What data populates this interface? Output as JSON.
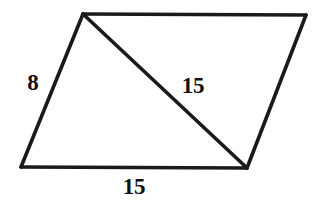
{
  "figure": {
    "kind": "parallelogram-with-diagonal",
    "background_color": "#ffffff",
    "stroke_color": "#1a1a1a",
    "label_color": "#111111",
    "canvas": {
      "width": 322,
      "height": 210
    },
    "vertices": {
      "top_left": {
        "x": 83,
        "y": 14
      },
      "top_right": {
        "x": 306,
        "y": 15
      },
      "bottom_right": {
        "x": 247,
        "y": 168
      },
      "bottom_left": {
        "x": 21,
        "y": 167
      }
    },
    "edges": [
      {
        "name": "top-edge",
        "from": "top_left",
        "to": "top_right"
      },
      {
        "name": "right-edge",
        "from": "top_right",
        "to": "bottom_right"
      },
      {
        "name": "bottom-edge",
        "from": "bottom_right",
        "to": "bottom_left"
      },
      {
        "name": "left-edge",
        "from": "bottom_left",
        "to": "top_left"
      }
    ],
    "diagonal": {
      "name": "diagonal",
      "from": "top_left",
      "to": "bottom_right"
    },
    "labels": [
      {
        "name": "left-side-length",
        "text": "8",
        "x": 33,
        "y": 82
      },
      {
        "name": "diagonal-length",
        "text": "15",
        "x": 193,
        "y": 85
      },
      {
        "name": "bottom-side-length",
        "text": "15",
        "x": 134,
        "y": 186
      }
    ]
  }
}
